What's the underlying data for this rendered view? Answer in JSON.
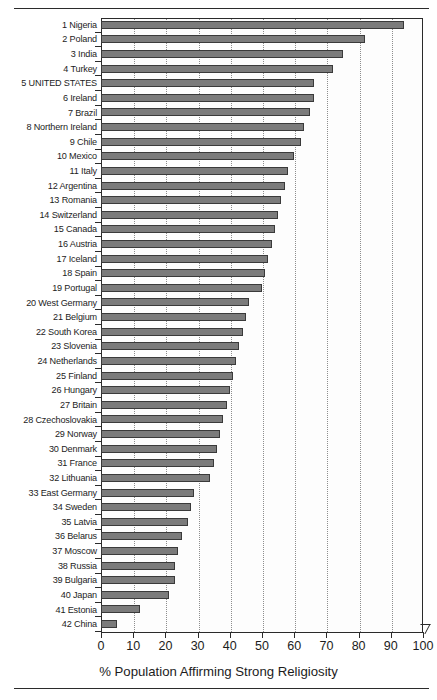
{
  "figure": {
    "axis_title": "% Population Affirming Strong Religiosity",
    "bar_color": "#7b7b7b",
    "bar_outline_color": "#3a3a3a",
    "grid_color": "#8d8d8d",
    "axis_color": "#2b2b2b"
  },
  "chart_data": {
    "type": "bar",
    "orientation": "horizontal",
    "title": "",
    "xlabel": "% Population Affirming Strong Religiosity",
    "ylabel": "",
    "xlim": [
      0,
      100
    ],
    "xticks": [
      0,
      10,
      20,
      30,
      40,
      50,
      60,
      70,
      80,
      90,
      100
    ],
    "grid": true,
    "legend": "none",
    "categories": [
      "1 Nigeria",
      "2 Poland",
      "3 India",
      "4 Turkey",
      "5 UNITED STATES",
      "6 Ireland",
      "7 Brazil",
      "8 Northern Ireland",
      "9 Chile",
      "10 Mexico",
      "11 Italy",
      "12 Argentina",
      "13 Romania",
      "14 Switzerland",
      "15 Canada",
      "16 Austria",
      "17 Iceland",
      "18 Spain",
      "19 Portugal",
      "20 West Germany",
      "21 Belgium",
      "22 South Korea",
      "23 Slovenia",
      "24 Netherlands",
      "25 Finland",
      "26 Hungary",
      "27 Britain",
      "28 Czechoslovakia",
      "29 Norway",
      "30 Denmark",
      "31 France",
      "32 Lithuania",
      "33 East Germany",
      "34 Sweden",
      "35 Latvia",
      "36 Belarus",
      "37 Moscow",
      "38 Russia",
      "39 Bulgaria",
      "40 Japan",
      "41 Estonia",
      "42 China"
    ],
    "values": [
      94,
      82,
      75,
      72,
      66,
      66,
      65,
      63,
      62,
      60,
      58,
      57,
      56,
      55,
      54,
      53,
      52,
      51,
      50,
      46,
      45,
      44,
      43,
      42,
      41,
      40,
      39,
      38,
      37,
      36,
      35,
      34,
      29,
      28,
      27,
      25,
      24,
      23,
      23,
      21,
      12,
      5
    ]
  }
}
